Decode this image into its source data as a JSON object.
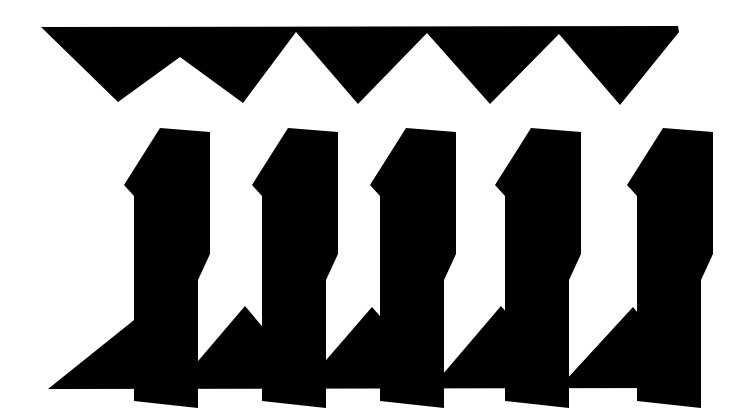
{
  "canvas": {
    "width": 739,
    "height": 413,
    "background_color": "#ffffff",
    "ink_color": "#000000",
    "description": "Abstract high-contrast black and white geometric composition"
  },
  "composition": {
    "band_count": 3,
    "bands": [
      {
        "name": "top-zigzag-band",
        "role": "upper sawtooth border",
        "orientation": "teeth point down",
        "tooth_count": 5,
        "left": 41,
        "right": 679,
        "top": 27,
        "bottom": 107
      },
      {
        "name": "middle-staircase-row",
        "role": "row of repeated Z-step polygons",
        "shape_count": 5,
        "top": 124,
        "bottom": 285
      },
      {
        "name": "bottom-zigzag-band",
        "role": "lower sawtooth border",
        "orientation": "teeth point up",
        "tooth_count": 5,
        "left": 48,
        "right": 694,
        "top": 307,
        "bottom": 389
      }
    ]
  },
  "geometry": {
    "top_zigzag": {
      "label": "Top sawtooth strip",
      "points": "41,27 678,26 679,32 620,105 559,34 490,104 427,33 358,104 296,32 243,103 180,57 118,102",
      "valley_x": [
        118,
        243,
        358,
        490,
        620
      ],
      "peak_x": [
        180,
        296,
        427,
        559
      ],
      "baseline_y": 27
    },
    "bottom_zigzag": {
      "label": "Bottom sawtooth strip",
      "points": "48,389 693,388 694,382 633,307 565,381 501,306 437,381 372,307 308,381 245,306 181,381 149,308",
      "peak_x": [
        149,
        245,
        372,
        501,
        633
      ],
      "valley_x": [
        181,
        308,
        437,
        565
      ],
      "baseline_y": 389
    },
    "staircase_template": {
      "label": "Z-step polygon",
      "note": "Tall upper-right block stepping down-left into a tall lower-left block, slightly skewed right",
      "points": "36,10 86,14 86,136 74,162 74,290 10,283 10,78 0,67 36,10",
      "local_width": 90,
      "local_height": 300
    },
    "staircase_instances": [
      {
        "id": 1,
        "label": "staircase-1",
        "x": 124,
        "y": 118
      },
      {
        "id": 2,
        "label": "staircase-2",
        "x": 252,
        "y": 118
      },
      {
        "id": 3,
        "label": "staircase-3",
        "x": 370,
        "y": 118
      },
      {
        "id": 4,
        "label": "staircase-4",
        "x": 495,
        "y": 118
      },
      {
        "id": 5,
        "label": "staircase-5",
        "x": 627,
        "y": 118
      }
    ]
  },
  "accessibility": {
    "alt_text": "Black and white abstract graphic: a downward zigzag band at the top, five repeated angular step shapes in the middle, and an upward zigzag band at the bottom."
  }
}
